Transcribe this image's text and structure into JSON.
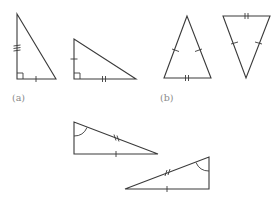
{
  "figure": {
    "labels": {
      "a": "(a)",
      "b": "(b)"
    },
    "colors": {
      "stroke": "#3a3a3a",
      "label": "#8a8a8a",
      "background": "#ffffff"
    },
    "groups": [
      {
        "id": "a",
        "label": "(a)",
        "triangles": [
          {
            "name": "right-triangle-a1",
            "vertices": [
              [
                17,
                14
              ],
              [
                17,
                79
              ],
              [
                56,
                79
              ]
            ],
            "right_angle_at": [
              17,
              79
            ],
            "marks": [
              {
                "side": "vertical-leg",
                "ticks": 3
              },
              {
                "side": "base",
                "ticks": 1
              }
            ]
          },
          {
            "name": "right-triangle-a2",
            "vertices": [
              [
                74,
                39
              ],
              [
                74,
                79
              ],
              [
                136,
                79
              ]
            ],
            "right_angle_at": [
              74,
              79
            ],
            "marks": [
              {
                "side": "vertical-leg",
                "ticks": 1
              },
              {
                "side": "base",
                "ticks": 2
              }
            ]
          }
        ]
      },
      {
        "id": "b",
        "label": "(b)",
        "triangles": [
          {
            "name": "isosceles-triangle-b1",
            "vertices": [
              [
                187,
                16
              ],
              [
                164,
                78
              ],
              [
                211,
                78
              ]
            ],
            "marks": [
              {
                "side": "left-leg",
                "ticks": 1
              },
              {
                "side": "right-leg",
                "ticks": 1
              },
              {
                "side": "base",
                "ticks": 2
              }
            ]
          },
          {
            "name": "isosceles-triangle-b2-inverted",
            "vertices": [
              [
                223,
                16
              ],
              [
                270,
                16
              ],
              [
                246,
                78
              ]
            ],
            "marks": [
              {
                "side": "top",
                "ticks": 2
              },
              {
                "side": "left-leg",
                "ticks": 1
              },
              {
                "side": "right-leg",
                "ticks": 1
              }
            ]
          }
        ]
      },
      {
        "id": "c",
        "label": "",
        "triangles": [
          {
            "name": "right-triangle-c1",
            "vertices": [
              [
                74,
                122
              ],
              [
                74,
                154
              ],
              [
                158,
                154
              ]
            ],
            "angle_arc_at": [
              74,
              122
            ],
            "marks": [
              {
                "side": "hypotenuse",
                "ticks": 2
              },
              {
                "side": "base",
                "ticks": 1
              }
            ]
          },
          {
            "name": "right-triangle-c2",
            "vertices": [
              [
                209,
                157
              ],
              [
                209,
                189
              ],
              [
                125,
                189
              ]
            ],
            "angle_arc_at": [
              209,
              157
            ],
            "marks": [
              {
                "side": "hypotenuse",
                "ticks": 2
              },
              {
                "side": "base",
                "ticks": 1
              }
            ]
          }
        ]
      }
    ]
  }
}
